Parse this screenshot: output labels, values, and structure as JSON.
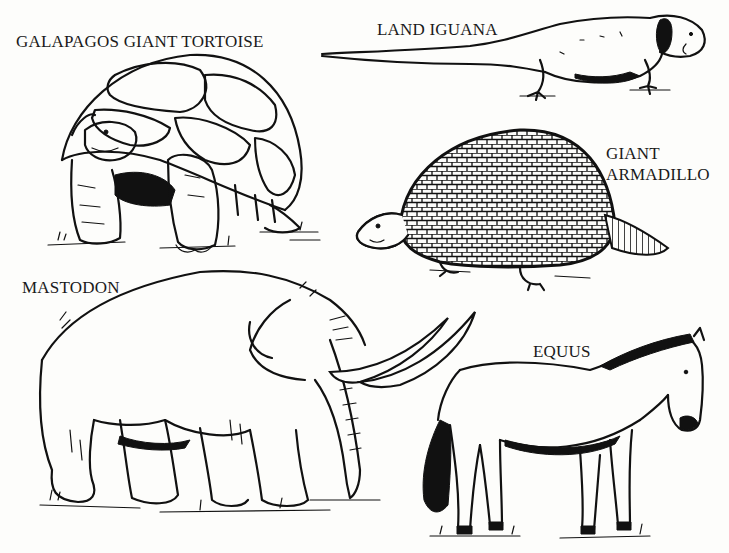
{
  "illustration": {
    "style": "black-and-white pen line drawing",
    "background_color": "#fdfdfb",
    "ink_color": "#111111"
  },
  "labels": {
    "tortoise": "GALAPAGOS GIANT TORTOISE",
    "iguana": "LAND IGUANA",
    "armadillo_line1": "GIANT",
    "armadillo_line2": "ARMADILLO",
    "mastodon": "MASTODON",
    "equus": "EQUUS"
  },
  "animals": [
    {
      "name": "Galapagos Giant Tortoise",
      "position": "top-left"
    },
    {
      "name": "Land Iguana",
      "position": "top-right"
    },
    {
      "name": "Giant Armadillo",
      "position": "middle-right"
    },
    {
      "name": "Mastodon",
      "position": "bottom-left"
    },
    {
      "name": "Equus",
      "position": "bottom-right"
    }
  ]
}
